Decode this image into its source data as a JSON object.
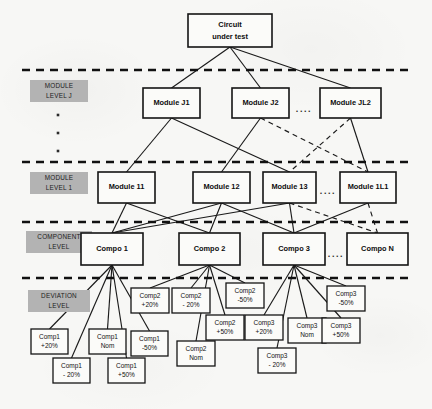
{
  "figure": {
    "width": 432,
    "height": 409,
    "background": "#f7f7f5",
    "ink": "#141414",
    "band_fill": "#b3b3b3",
    "caption": "Fig. 2. General Partitioning of a circuit under test"
  },
  "level_bands": [
    {
      "id": "module-level-j",
      "line1": "MODULE",
      "line2": "LEVEL J",
      "x": 30,
      "y": 80,
      "w": 58,
      "h": 22
    },
    {
      "id": "module-level-1",
      "line1": "MODULE",
      "line2": "LEVEL 1",
      "x": 30,
      "y": 172,
      "w": 58,
      "h": 22
    },
    {
      "id": "component-level",
      "line1": "COMPONENT",
      "line2": "LEVEL",
      "x": 26,
      "y": 231,
      "w": 66,
      "h": 22
    },
    {
      "id": "deviation-level",
      "line1": "DEVIATION",
      "line2": "LEVEL",
      "x": 28,
      "y": 290,
      "w": 62,
      "h": 22
    }
  ],
  "level_rules": [
    {
      "id": "rule-above-module-j",
      "y": 70,
      "x1": 22,
      "x2": 409
    },
    {
      "id": "rule-above-module-1",
      "y": 162,
      "x1": 22,
      "x2": 409
    },
    {
      "id": "rule-above-component",
      "y": 222,
      "x1": 22,
      "x2": 409
    },
    {
      "id": "rule-above-deviation",
      "y": 278,
      "x1": 22,
      "x2": 409
    }
  ],
  "vertical_dots": [
    {
      "cx": 58,
      "cy": 115
    },
    {
      "cx": 58,
      "cy": 133
    },
    {
      "cx": 58,
      "cy": 151
    }
  ],
  "root": {
    "id": "circuit-under-test",
    "line1": "Circuit",
    "line2": "under test",
    "x": 188,
    "y": 14,
    "w": 84,
    "h": 33
  },
  "module_level_j": {
    "nodes": [
      {
        "id": "module-j1",
        "label": "Module J1",
        "x": 143,
        "y": 88,
        "w": 57,
        "h": 30
      },
      {
        "id": "module-j2",
        "label": "Module J2",
        "x": 232,
        "y": 88,
        "w": 57,
        "h": 30
      },
      {
        "id": "module-jl2",
        "label": "Module JL2",
        "x": 320,
        "y": 88,
        "w": 61,
        "h": 30
      }
    ],
    "ellipsis": {
      "id": "ellipsis-module-j",
      "text": "....",
      "x": 304,
      "y": 110
    }
  },
  "module_level_1": {
    "nodes": [
      {
        "id": "module-11",
        "label": "Module 11",
        "x": 98,
        "y": 172,
        "w": 57,
        "h": 31
      },
      {
        "id": "module-12",
        "label": "Module 12",
        "x": 193,
        "y": 172,
        "w": 57,
        "h": 31
      },
      {
        "id": "module-13",
        "label": "Module 13",
        "x": 263,
        "y": 172,
        "w": 53,
        "h": 31
      },
      {
        "id": "module-1l1",
        "label": "Module 1L1",
        "x": 340,
        "y": 172,
        "w": 56,
        "h": 31
      }
    ],
    "ellipsis": {
      "id": "ellipsis-module-1",
      "text": "....",
      "x": 328,
      "y": 192
    }
  },
  "component_level": {
    "nodes": [
      {
        "id": "compo-1",
        "label": "Compo 1",
        "x": 81,
        "y": 233,
        "w": 62,
        "h": 32
      },
      {
        "id": "compo-2",
        "label": "Compo 2",
        "x": 179,
        "y": 233,
        "w": 61,
        "h": 32
      },
      {
        "id": "compo-3",
        "label": "Compo 3",
        "x": 263,
        "y": 233,
        "w": 62,
        "h": 32
      },
      {
        "id": "compo-n",
        "label": "Compo N",
        "x": 347,
        "y": 233,
        "w": 61,
        "h": 32
      }
    ],
    "ellipsis": {
      "id": "ellipsis-component",
      "text": "....",
      "x": 336,
      "y": 255
    }
  },
  "deviation_level": {
    "groups": [
      {
        "id": "deviations-compo-1",
        "parent": "compo-1",
        "nodes": [
          {
            "id": "comp1-plus-20",
            "line1": "Comp1",
            "line2": "+20%",
            "x": 31,
            "y": 329,
            "w": 37,
            "h": 25
          },
          {
            "id": "comp1-minus-20",
            "line1": "Comp1",
            "line2": "- 20%",
            "x": 53,
            "y": 358,
            "w": 37,
            "h": 25
          },
          {
            "id": "comp1-nom",
            "line1": "Comp1",
            "line2": "Nom",
            "x": 89,
            "y": 329,
            "w": 37,
            "h": 25
          },
          {
            "id": "comp1-plus-50",
            "line1": "Comp1",
            "line2": "+50%",
            "x": 108,
            "y": 358,
            "w": 37,
            "h": 25
          },
          {
            "id": "comp1-minus-50",
            "line1": "Comp1",
            "line2": "-50%",
            "x": 131,
            "y": 331,
            "w": 37,
            "h": 25
          }
        ]
      },
      {
        "id": "deviations-compo-2",
        "parent": "compo-2",
        "nodes": [
          {
            "id": "comp2-plus-20",
            "line1": "Comp2",
            "line2": "+20%",
            "x": 131,
            "y": 288,
            "w": 38,
            "h": 25
          },
          {
            "id": "comp2-minus-20",
            "line1": "Comp2",
            "line2": "- 20%",
            "x": 172,
            "y": 288,
            "w": 38,
            "h": 25
          },
          {
            "id": "comp2-nom",
            "line1": "Comp2",
            "line2": "Nom",
            "x": 177,
            "y": 341,
            "w": 38,
            "h": 25
          },
          {
            "id": "comp2-plus-50",
            "line1": "Comp2",
            "line2": "+50%",
            "x": 206,
            "y": 315,
            "w": 38,
            "h": 25
          },
          {
            "id": "comp2-minus-50",
            "line1": "Comp2",
            "line2": "-50%",
            "x": 226,
            "y": 283,
            "w": 38,
            "h": 25
          }
        ]
      },
      {
        "id": "deviations-compo-3",
        "parent": "compo-3",
        "nodes": [
          {
            "id": "comp3-plus-20",
            "line1": "Comp3",
            "line2": "+20%",
            "x": 245,
            "y": 315,
            "w": 38,
            "h": 25
          },
          {
            "id": "comp3-minus-20",
            "line1": "Comp3",
            "line2": "- 20%",
            "x": 258,
            "y": 348,
            "w": 38,
            "h": 25
          },
          {
            "id": "comp3-nom",
            "line1": "Comp3",
            "line2": "Nom",
            "x": 288,
            "y": 318,
            "w": 38,
            "h": 25
          },
          {
            "id": "comp3-plus-50",
            "line1": "Comp3",
            "line2": "+50%",
            "x": 322,
            "y": 318,
            "w": 38,
            "h": 25
          },
          {
            "id": "comp3-minus-50",
            "line1": "Comp3",
            "line2": "-50%",
            "x": 327,
            "y": 286,
            "w": 38,
            "h": 25
          }
        ]
      }
    ]
  },
  "edges": {
    "root_to_module_j": [
      {
        "from": "circuit-under-test",
        "to": "module-j1",
        "style": "solid"
      },
      {
        "from": "circuit-under-test",
        "to": "module-j2",
        "style": "solid"
      },
      {
        "from": "circuit-under-test",
        "to": "module-jl2",
        "style": "solid"
      }
    ],
    "module_j_to_module_1": [
      {
        "from": "module-j1",
        "to": "module-11",
        "style": "solid"
      },
      {
        "from": "module-j1",
        "to": "module-13",
        "style": "solid"
      },
      {
        "from": "module-j2",
        "to": "module-12",
        "style": "solid"
      },
      {
        "from": "module-j2",
        "to": "module-1l1",
        "style": "dashed"
      },
      {
        "from": "module-jl2",
        "to": "module-13",
        "style": "dashed"
      },
      {
        "from": "module-jl2",
        "to": "module-1l1",
        "style": "solid"
      }
    ],
    "module_1_to_component": [
      {
        "from": "module-11",
        "to": "compo-1",
        "style": "solid"
      },
      {
        "from": "module-11",
        "to": "compo-2",
        "style": "solid"
      },
      {
        "from": "module-12",
        "to": "compo-1",
        "style": "solid"
      },
      {
        "from": "module-12",
        "to": "compo-2",
        "style": "solid"
      },
      {
        "from": "module-12",
        "to": "compo-3",
        "style": "solid"
      },
      {
        "from": "module-13",
        "to": "compo-1",
        "style": "solid"
      },
      {
        "from": "module-13",
        "to": "compo-3",
        "style": "solid"
      },
      {
        "from": "module-13",
        "to": "compo-n",
        "style": "dashed"
      },
      {
        "from": "module-1l1",
        "to": "compo-3",
        "style": "solid"
      },
      {
        "from": "module-1l1",
        "to": "compo-n",
        "style": "dashed"
      }
    ]
  }
}
